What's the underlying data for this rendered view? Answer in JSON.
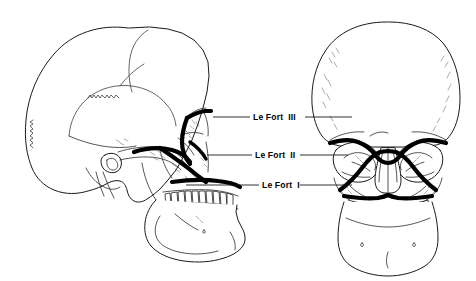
{
  "figure": {
    "background_color": "#ffffff",
    "line_color": "#000000",
    "fracture_line_color": "#000000",
    "views": [
      {
        "name": "lateral-skull-view",
        "position": "left",
        "orientation": "facing right"
      },
      {
        "name": "frontal-skull-view",
        "position": "right",
        "orientation": "anteroposterior"
      }
    ]
  },
  "labels": [
    {
      "id": "le-fort-3",
      "text": "Le Fort  III",
      "level": "III",
      "y": 117,
      "leader_left_x1": 213,
      "leader_left_x2": 250,
      "leader_right_x1": 305,
      "leader_right_x2": 352
    },
    {
      "id": "le-fort-2",
      "text": "Le Fort  II",
      "level": "II",
      "y": 155,
      "leader_left_x1": 207,
      "leader_left_x2": 252,
      "leader_right_x1": 300,
      "leader_right_x2": 348
    },
    {
      "id": "le-fort-1",
      "text": "Le Fort  I",
      "level": "I",
      "y": 185,
      "leader_left_x1": 186,
      "leader_left_x2": 259,
      "leader_right_x1": 300,
      "leader_right_x2": 352
    }
  ]
}
